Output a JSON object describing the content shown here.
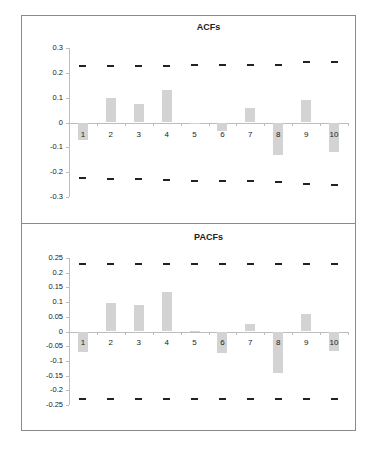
{
  "chart_data": [
    {
      "type": "bar",
      "title": "ACFs",
      "xlabel": "",
      "ylabel": "",
      "categories": [
        "1",
        "2",
        "3",
        "4",
        "5",
        "6",
        "7",
        "8",
        "9",
        "10"
      ],
      "values": [
        -0.07,
        0.1,
        0.076,
        0.13,
        0.0,
        -0.035,
        0.058,
        -0.13,
        0.09,
        -0.12
      ],
      "upper_bound": [
        0.228,
        0.228,
        0.228,
        0.228,
        0.232,
        0.232,
        0.232,
        0.232,
        0.243,
        0.245
      ],
      "lower_bound": [
        -0.222,
        -0.226,
        -0.228,
        -0.232,
        -0.236,
        -0.236,
        -0.236,
        -0.24,
        -0.247,
        -0.25
      ],
      "yticks": [
        "0.3",
        "0.2",
        "0.1",
        "0",
        "-0.1",
        "-0.2",
        "-0.3"
      ],
      "ylim": [
        -0.3,
        0.3
      ],
      "grid": false,
      "legend": "none",
      "bar_color": "#d3d3d3",
      "bound_marker_color": "#222222"
    },
    {
      "type": "bar",
      "title": "PACFs",
      "xlabel": "",
      "ylabel": "",
      "categories": [
        "1",
        "2",
        "3",
        "4",
        "5",
        "6",
        "7",
        "8",
        "9",
        "10"
      ],
      "values": [
        -0.07,
        0.098,
        0.089,
        0.136,
        0.002,
        -0.072,
        0.027,
        -0.142,
        0.058,
        -0.068
      ],
      "upper_bound": [
        0.228,
        0.228,
        0.228,
        0.228,
        0.228,
        0.228,
        0.228,
        0.228,
        0.228,
        0.228
      ],
      "lower_bound": [
        -0.228,
        -0.228,
        -0.228,
        -0.228,
        -0.228,
        -0.228,
        -0.228,
        -0.228,
        -0.228,
        -0.228
      ],
      "yticks": [
        "0.25",
        "0.2",
        "0.15",
        "0.1",
        "0.05",
        "0",
        "-0.05",
        "-0.1",
        "-0.15",
        "-0.2",
        "-0.25"
      ],
      "ylim": [
        -0.25,
        0.25
      ],
      "grid": false,
      "legend": "none",
      "bar_color": "#d3d3d3",
      "bound_marker_color": "#222222"
    }
  ]
}
